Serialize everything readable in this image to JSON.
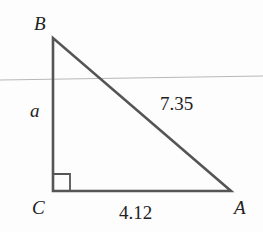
{
  "diagram": {
    "type": "right-triangle",
    "vertices": {
      "B": {
        "label": "B"
      },
      "C": {
        "label": "C"
      },
      "A": {
        "label": "A"
      }
    },
    "sides": {
      "BC": {
        "label": "a"
      },
      "AB": {
        "label": "7.35"
      },
      "CA": {
        "label": "4.12"
      }
    },
    "right_angle_at": "C",
    "colors": {
      "stroke": "#555555",
      "rule_line": "#b8b8b8",
      "text": "#222222"
    }
  }
}
